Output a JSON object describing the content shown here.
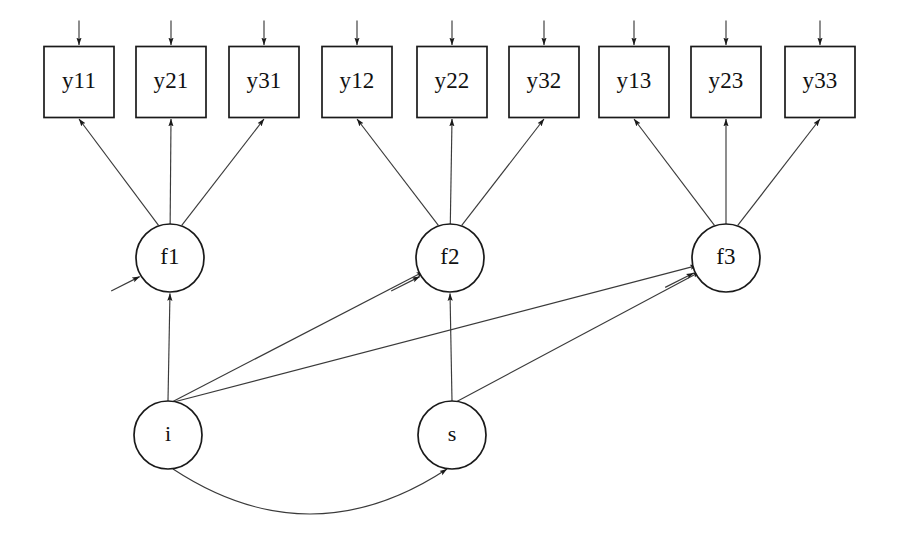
{
  "figure": {
    "kind": "sem-path-diagram",
    "title": "",
    "background_color": "#ffffff",
    "stroke_color": "#1a1a1a",
    "edge_color": "#3a3a3a",
    "width": 898,
    "height": 542
  },
  "observed_variables": [
    {
      "id": "y11",
      "label": "y11",
      "x": 79,
      "y": 82,
      "w": 70,
      "h": 71,
      "group": 1
    },
    {
      "id": "y21",
      "label": "y21",
      "x": 171,
      "y": 82,
      "w": 70,
      "h": 71,
      "group": 1
    },
    {
      "id": "y31",
      "label": "y31",
      "x": 264,
      "y": 82,
      "w": 70,
      "h": 71,
      "group": 1
    },
    {
      "id": "y12",
      "label": "y12",
      "x": 357,
      "y": 82,
      "w": 70,
      "h": 71,
      "group": 2
    },
    {
      "id": "y22",
      "label": "y22",
      "x": 452,
      "y": 82,
      "w": 70,
      "h": 71,
      "group": 2
    },
    {
      "id": "y32",
      "label": "y32",
      "x": 544,
      "y": 82,
      "w": 70,
      "h": 71,
      "group": 2
    },
    {
      "id": "y13",
      "label": "y13",
      "x": 634,
      "y": 82,
      "w": 70,
      "h": 71,
      "group": 3
    },
    {
      "id": "y23",
      "label": "y23",
      "x": 726,
      "y": 82,
      "w": 70,
      "h": 71,
      "group": 3
    },
    {
      "id": "y33",
      "label": "y33",
      "x": 820,
      "y": 82,
      "w": 70,
      "h": 71,
      "group": 3
    }
  ],
  "latent_variables": [
    {
      "id": "f1",
      "label": "f1",
      "x": 170,
      "y": 258,
      "rx": 34,
      "ry": 34,
      "level": "first-order"
    },
    {
      "id": "f2",
      "label": "f2",
      "x": 450,
      "y": 258,
      "rx": 34,
      "ry": 34,
      "level": "first-order"
    },
    {
      "id": "f3",
      "label": "f3",
      "x": 726,
      "y": 258,
      "rx": 34,
      "ry": 34,
      "level": "first-order"
    },
    {
      "id": "i",
      "label": "i",
      "x": 168,
      "y": 435,
      "rx": 34,
      "ry": 34,
      "level": "second-order"
    },
    {
      "id": "s",
      "label": "s",
      "x": 452,
      "y": 435,
      "rx": 34,
      "ry": 34,
      "level": "second-order"
    }
  ],
  "loadings": [
    {
      "from": "f1",
      "to": "y11"
    },
    {
      "from": "f1",
      "to": "y21"
    },
    {
      "from": "f1",
      "to": "y31"
    },
    {
      "from": "f2",
      "to": "y12"
    },
    {
      "from": "f2",
      "to": "y22"
    },
    {
      "from": "f2",
      "to": "y32"
    },
    {
      "from": "f3",
      "to": "y13"
    },
    {
      "from": "f3",
      "to": "y23"
    },
    {
      "from": "f3",
      "to": "y33"
    }
  ],
  "structural_paths": [
    {
      "from": "i",
      "to": "f1"
    },
    {
      "from": "i",
      "to": "f2"
    },
    {
      "from": "i",
      "to": "f3"
    },
    {
      "from": "s",
      "to": "f2"
    },
    {
      "from": "s",
      "to": "f3"
    }
  ],
  "covariances": [
    {
      "between": [
        "i",
        "s"
      ],
      "style": "curved-double-headed"
    }
  ],
  "residual_arrows_observed": [
    {
      "target": "y11"
    },
    {
      "target": "y21"
    },
    {
      "target": "y31"
    },
    {
      "target": "y12"
    },
    {
      "target": "y22"
    },
    {
      "target": "y32"
    },
    {
      "target": "y13"
    },
    {
      "target": "y23"
    },
    {
      "target": "y33"
    }
  ],
  "residual_arrows_latent": [
    {
      "target": "f1"
    },
    {
      "target": "f2"
    },
    {
      "target": "f3"
    }
  ]
}
